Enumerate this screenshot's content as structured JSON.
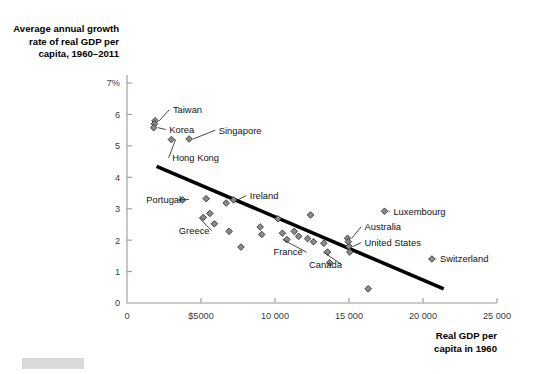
{
  "figure": {
    "y_axis_title": [
      "Average annual growth",
      "rate of real GDP per",
      "capita, 1960–2011"
    ],
    "x_axis_title": [
      "Real GDP per",
      "capita in 1960"
    ]
  },
  "chart_data": {
    "type": "scatter",
    "title": "",
    "subtitle": "",
    "xlabel": "Real GDP per capita in 1960",
    "ylabel": "Average annual growth rate of real GDP per capita, 1960–2011",
    "xlim": [
      0,
      25000
    ],
    "ylim": [
      0,
      7
    ],
    "grid": false,
    "legend": null,
    "x_ticks": [
      0,
      5000,
      10000,
      15000,
      20000,
      25000
    ],
    "x_tick_labels": [
      "0",
      "$5000",
      "10 000",
      "15 000",
      "20 000",
      "25 000"
    ],
    "y_ticks": [
      0,
      1,
      2,
      3,
      4,
      5,
      6,
      7
    ],
    "y_tick_labels": [
      "0",
      "1",
      "2",
      "3",
      "4",
      "5",
      "6",
      "7%"
    ],
    "trendline": {
      "x0": 2000,
      "y0": 4.35,
      "x1": 21400,
      "y1": 0.45,
      "color": "#000000"
    },
    "points": [
      {
        "label": "Taiwan",
        "x": 1900,
        "y": 5.8,
        "labeled": true,
        "label_x": 3100,
        "label_y": 6.15,
        "anchor": "start"
      },
      {
        "label": "",
        "x": 1850,
        "y": 5.7,
        "labeled": false
      },
      {
        "label": "Korea",
        "x": 1800,
        "y": 5.58,
        "labeled": true,
        "label_x": 2850,
        "label_y": 5.52,
        "anchor": "start"
      },
      {
        "label": "Hong Kong",
        "x": 3000,
        "y": 5.2,
        "labeled": true,
        "label_x": 3050,
        "label_y": 4.62,
        "anchor": "start"
      },
      {
        "label": "Singapore",
        "x": 4200,
        "y": 5.22,
        "labeled": true,
        "label_x": 6200,
        "label_y": 5.5,
        "anchor": "start"
      },
      {
        "label": "Portugal",
        "x": 3750,
        "y": 3.28,
        "labeled": true,
        "label_x": 1300,
        "label_y": 3.3,
        "anchor": "start"
      },
      {
        "label": "",
        "x": 5350,
        "y": 3.32,
        "labeled": false
      },
      {
        "label": "",
        "x": 5600,
        "y": 2.85,
        "labeled": false
      },
      {
        "label": "Greece",
        "x": 5150,
        "y": 2.72,
        "labeled": true,
        "label_x": 3500,
        "label_y": 2.3,
        "anchor": "start"
      },
      {
        "label": "",
        "x": 5900,
        "y": 2.52,
        "labeled": false
      },
      {
        "label": "",
        "x": 6700,
        "y": 3.18,
        "labeled": false
      },
      {
        "label": "Ireland",
        "x": 7200,
        "y": 3.28,
        "labeled": true,
        "label_x": 8300,
        "label_y": 3.42,
        "anchor": "start"
      },
      {
        "label": "",
        "x": 6900,
        "y": 2.28,
        "labeled": false
      },
      {
        "label": "",
        "x": 7700,
        "y": 1.78,
        "labeled": false
      },
      {
        "label": "",
        "x": 9000,
        "y": 2.42,
        "labeled": false
      },
      {
        "label": "",
        "x": 9100,
        "y": 2.18,
        "labeled": false
      },
      {
        "label": "",
        "x": 10200,
        "y": 2.68,
        "labeled": false
      },
      {
        "label": "",
        "x": 10500,
        "y": 2.22,
        "labeled": false
      },
      {
        "label": "France",
        "x": 10800,
        "y": 2.02,
        "labeled": true,
        "label_x": 9900,
        "label_y": 1.62,
        "anchor": "start"
      },
      {
        "label": "",
        "x": 11300,
        "y": 2.28,
        "labeled": false
      },
      {
        "label": "",
        "x": 11600,
        "y": 2.12,
        "labeled": false
      },
      {
        "label": "",
        "x": 12400,
        "y": 2.8,
        "labeled": false
      },
      {
        "label": "",
        "x": 12200,
        "y": 2.05,
        "labeled": false
      },
      {
        "label": "",
        "x": 12600,
        "y": 1.95,
        "labeled": false
      },
      {
        "label": "",
        "x": 13300,
        "y": 1.9,
        "labeled": false
      },
      {
        "label": "Canada",
        "x": 13550,
        "y": 1.62,
        "labeled": true,
        "label_x": 12300,
        "label_y": 1.22,
        "anchor": "start"
      },
      {
        "label": "",
        "x": 13700,
        "y": 1.28,
        "labeled": false
      },
      {
        "label": "Australia",
        "x": 14900,
        "y": 2.06,
        "labeled": true,
        "label_x": 16050,
        "label_y": 2.42,
        "anchor": "start"
      },
      {
        "label": "United States",
        "x": 15000,
        "y": 1.8,
        "labeled": true,
        "label_x": 16050,
        "label_y": 1.92,
        "anchor": "start"
      },
      {
        "label": "",
        "x": 14950,
        "y": 1.95,
        "labeled": false
      },
      {
        "label": "",
        "x": 15050,
        "y": 1.62,
        "labeled": false
      },
      {
        "label": "Luxembourg",
        "x": 17400,
        "y": 2.92,
        "labeled": true,
        "label_x": 18000,
        "label_y": 2.92,
        "anchor": "start"
      },
      {
        "label": "Switzerland",
        "x": 20600,
        "y": 1.4,
        "labeled": true,
        "label_x": 21150,
        "label_y": 1.4,
        "anchor": "start"
      },
      {
        "label": "",
        "x": 16300,
        "y": 0.45,
        "labeled": false
      }
    ]
  }
}
